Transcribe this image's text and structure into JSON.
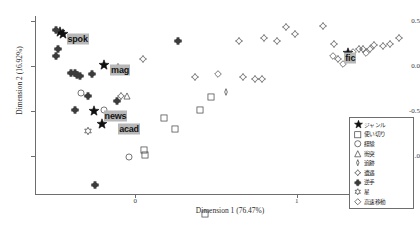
{
  "chart_data": {
    "type": "scatter",
    "title": "",
    "xlabel": "Dimension 1 (76.47%)",
    "ylabel": "Dimension 2 (16.92%)",
    "xlim": [
      -0.62,
      1.72
    ],
    "ylim": [
      -1.42,
      0.55
    ],
    "xticks": [
      0,
      1
    ],
    "xtick_labels": [
      "0",
      "1"
    ],
    "yticks": [
      0.5,
      0.0,
      -0.5,
      -1.0
    ],
    "ytick_labels": [
      "0.5",
      "0.0",
      "-0.5",
      "-1.0"
    ],
    "grid": false,
    "legend_position": "bottom-right",
    "genre_labels": [
      {
        "text": "spok",
        "x": -0.45,
        "y": 0.355
      },
      {
        "text": "mag",
        "x": -0.18,
        "y": 0.005
      },
      {
        "text": "news",
        "x": -0.22,
        "y": -0.505
      },
      {
        "text": "acad",
        "x": -0.13,
        "y": -0.645
      },
      {
        "text": "fic",
        "x": 1.27,
        "y": 0.145
      }
    ],
    "series": [
      {
        "name": "ジャンル",
        "marker": "star-filled",
        "points": [
          {
            "x": -0.465,
            "y": 0.375
          },
          {
            "x": -0.445,
            "y": 0.355
          },
          {
            "x": -0.195,
            "y": 0.005
          },
          {
            "x": -0.255,
            "y": -0.505
          },
          {
            "x": -0.205,
            "y": -0.645
          },
          {
            "x": 1.315,
            "y": 0.145
          }
        ]
      },
      {
        "name": "使い切り",
        "marker": "square",
        "points": [
          {
            "x": 0.47,
            "y": -0.345
          },
          {
            "x": 0.4,
            "y": -0.49
          },
          {
            "x": 0.18,
            "y": -0.575
          },
          {
            "x": 0.245,
            "y": -0.7
          },
          {
            "x": 0.055,
            "y": -0.935
          },
          {
            "x": 0.06,
            "y": -0.99
          },
          {
            "x": 0.435,
            "y": -1.64
          }
        ]
      },
      {
        "name": "経験",
        "marker": "circle",
        "points": [
          {
            "x": -0.335,
            "y": -0.3
          },
          {
            "x": -0.195,
            "y": -0.495
          },
          {
            "x": -0.04,
            "y": -1.015
          }
        ]
      },
      {
        "name": "衝突",
        "marker": "triangle",
        "points": [
          {
            "x": -0.05,
            "y": -0.33
          }
        ]
      },
      {
        "name": "追跡",
        "marker": "lens",
        "points": [
          {
            "x": 0.565,
            "y": -0.29
          }
        ]
      },
      {
        "name": "遭遇",
        "marker": "diamond4",
        "points": [
          {
            "x": -0.105,
            "y": -0.015
          },
          {
            "x": 0.05,
            "y": 0.07
          },
          {
            "x": -0.085,
            "y": -0.33
          },
          {
            "x": 0.37,
            "y": -0.12
          },
          {
            "x": 0.665,
            "y": -0.12
          },
          {
            "x": 0.74,
            "y": -0.15
          },
          {
            "x": 0.785,
            "y": -0.145
          },
          {
            "x": 0.64,
            "y": 0.27
          },
          {
            "x": 0.795,
            "y": 0.305
          },
          {
            "x": 0.88,
            "y": 0.275
          },
          {
            "x": 0.99,
            "y": 0.35
          },
          {
            "x": 0.935,
            "y": 0.425
          },
          {
            "x": 1.16,
            "y": 0.44
          },
          {
            "x": 1.23,
            "y": 0.245
          },
          {
            "x": 1.255,
            "y": 0.07
          },
          {
            "x": 1.33,
            "y": 0.09
          },
          {
            "x": 1.385,
            "y": 0.185
          },
          {
            "x": 1.41,
            "y": 0.18
          },
          {
            "x": 1.455,
            "y": 0.19
          },
          {
            "x": 1.48,
            "y": 0.23
          },
          {
            "x": 1.535,
            "y": 0.215
          },
          {
            "x": 1.58,
            "y": 0.24
          },
          {
            "x": 1.635,
            "y": 0.305
          }
        ]
      },
      {
        "name": "逆手",
        "marker": "cross-star",
        "points": [
          {
            "x": -0.49,
            "y": 0.395
          },
          {
            "x": -0.475,
            "y": 0.185
          },
          {
            "x": -0.49,
            "y": 0.11
          },
          {
            "x": -0.4,
            "y": -0.085
          },
          {
            "x": -0.375,
            "y": -0.085
          },
          {
            "x": -0.36,
            "y": -0.105
          },
          {
            "x": -0.34,
            "y": -0.11
          },
          {
            "x": -0.265,
            "y": -0.095
          },
          {
            "x": -0.29,
            "y": -0.34
          },
          {
            "x": -0.375,
            "y": -0.485
          },
          {
            "x": -0.115,
            "y": -0.395
          },
          {
            "x": 0.265,
            "y": 0.275
          },
          {
            "x": -0.25,
            "y": -1.32
          }
        ]
      },
      {
        "name": "星",
        "marker": "star-open",
        "points": [
          {
            "x": -0.29,
            "y": -0.72
          }
        ]
      },
      {
        "name": "高速移動",
        "marker": "diamond-thin",
        "points": [
          {
            "x": 0.51,
            "y": -0.095
          },
          {
            "x": 1.225,
            "y": 0.11
          },
          {
            "x": 1.285,
            "y": 0.02
          },
          {
            "x": 1.35,
            "y": 0.155
          },
          {
            "x": 1.43,
            "y": 0.145
          }
        ]
      }
    ],
    "legend_entries": [
      {
        "label": "ジャンル",
        "marker": "star-filled"
      },
      {
        "label": "使い切り",
        "marker": "square"
      },
      {
        "label": "経験",
        "marker": "circle"
      },
      {
        "label": "衝突",
        "marker": "triangle"
      },
      {
        "label": "追跡",
        "marker": "lens"
      },
      {
        "label": "遭遇",
        "marker": "diamond4"
      },
      {
        "label": "逆手",
        "marker": "cross-star"
      },
      {
        "label": "星",
        "marker": "star-open"
      },
      {
        "label": "高速移動",
        "marker": "diamond-thin"
      }
    ],
    "colors": {
      "marker_stroke": "#3c3c3c",
      "marker_fill_solid": "#111111",
      "axis": "#6e6e6e",
      "label_background": "#b8b8b8",
      "text": "#1a1a1a"
    }
  }
}
